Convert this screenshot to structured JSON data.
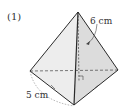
{
  "problem": {
    "number_label": "(1)",
    "shape": "triangular pyramid",
    "height_label": "6 cm",
    "base_edge_label": "5 cm",
    "right_angle_mark": true
  },
  "colors": {
    "stroke": "#2a2a2a",
    "face_light": "#f2f2f2",
    "face_mid": "#e4e4e4",
    "face_dark": "#d6d6d6",
    "text": "#333333"
  }
}
